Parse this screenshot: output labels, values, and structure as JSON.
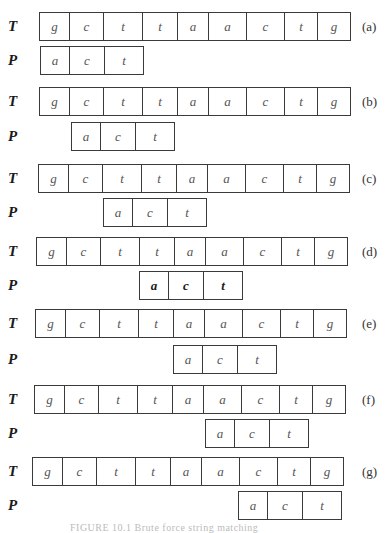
{
  "figure": {
    "text_label": "T",
    "pattern_label": "P",
    "text_chars": [
      "g",
      "c",
      "t",
      "t",
      "a",
      "a",
      "c",
      "t",
      "g"
    ],
    "pattern_chars": [
      "a",
      "c",
      "t"
    ],
    "caption": "FIGURE 10.1  Brute force string matching",
    "steps": [
      {
        "label": "(a)",
        "shift": 0,
        "highlight": false
      },
      {
        "label": "(b)",
        "shift": 1,
        "highlight": false
      },
      {
        "label": "(c)",
        "shift": 2,
        "highlight": false
      },
      {
        "label": "(d)",
        "shift": 3,
        "highlight": true
      },
      {
        "label": "(e)",
        "shift": 4,
        "highlight": false
      },
      {
        "label": "(f)",
        "shift": 5,
        "highlight": false
      },
      {
        "label": "(g)",
        "shift": 6,
        "highlight": false
      }
    ]
  },
  "colors": {
    "border": "#3a3a3a",
    "text": "#555555",
    "highlight_text": "#1a1a1a",
    "background": "#ffffff"
  }
}
